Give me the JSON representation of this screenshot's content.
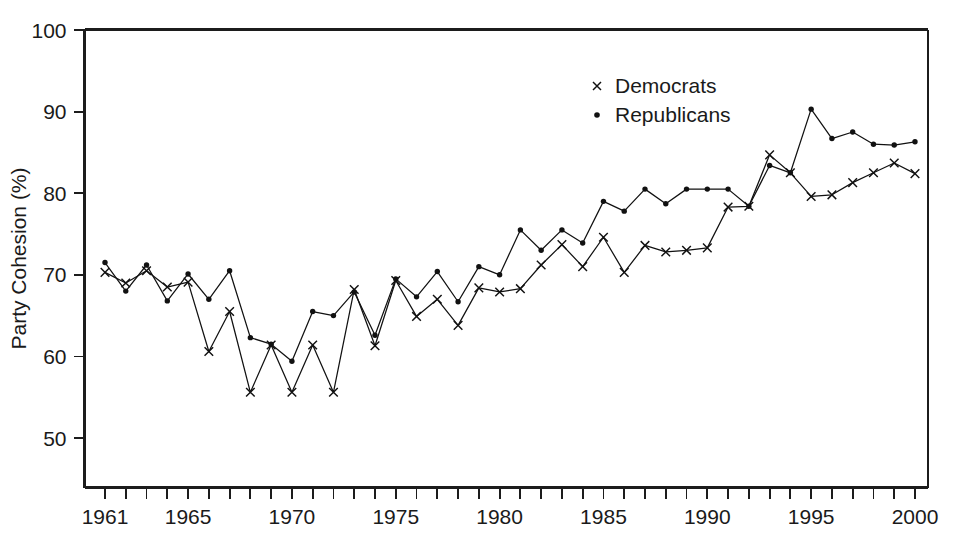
{
  "chart_data": {
    "type": "line",
    "title": "",
    "xlabel": "",
    "ylabel": "Party Cohesion (%)",
    "xlim": [
      1961,
      2000
    ],
    "ylim": [
      47,
      100
    ],
    "y_ticks": [
      50,
      60,
      70,
      80,
      90,
      100
    ],
    "y_tick_labels": [
      "50",
      "60",
      "70",
      "80",
      "90",
      "100"
    ],
    "x_ticks": [
      1961,
      1962,
      1963,
      1964,
      1965,
      1966,
      1967,
      1968,
      1969,
      1970,
      1971,
      1972,
      1973,
      1974,
      1975,
      1976,
      1977,
      1978,
      1979,
      1980,
      1981,
      1982,
      1983,
      1984,
      1985,
      1986,
      1987,
      1988,
      1989,
      1990,
      1991,
      1992,
      1993,
      1994,
      1995,
      1996,
      1997,
      1998,
      1999,
      2000
    ],
    "x_tick_labels": [
      "1961",
      "1965",
      "1970",
      "1975",
      "1980",
      "1985",
      "1990",
      "1995",
      "2000"
    ],
    "x_labeled_years": [
      1961,
      1965,
      1970,
      1975,
      1980,
      1985,
      1990,
      1995,
      2000
    ],
    "grid": false,
    "legend_position": "top-center",
    "x": [
      1961,
      1962,
      1963,
      1964,
      1965,
      1966,
      1967,
      1968,
      1969,
      1970,
      1971,
      1972,
      1973,
      1974,
      1975,
      1976,
      1977,
      1978,
      1979,
      1980,
      1981,
      1982,
      1983,
      1984,
      1985,
      1986,
      1987,
      1988,
      1989,
      1990,
      1991,
      1992,
      1993,
      1994,
      1995,
      1996,
      1997,
      1998,
      1999,
      2000
    ],
    "series": [
      {
        "name": "Democrats",
        "marker": "x",
        "color": "#111111",
        "values": [
          70.3,
          69.0,
          70.5,
          68.5,
          69.1,
          60.6,
          65.5,
          55.6,
          61.4,
          55.6,
          61.4,
          55.6,
          68.2,
          61.3,
          69.3,
          64.9,
          67.0,
          63.8,
          68.4,
          67.9,
          68.3,
          71.2,
          73.7,
          71.0,
          74.6,
          70.3,
          73.6,
          72.8,
          73.0,
          73.3,
          78.3,
          78.4,
          84.7,
          82.5,
          79.6,
          79.8,
          81.3,
          82.5,
          83.7,
          82.4
        ]
      },
      {
        "name": "Republicans",
        "marker": "dot",
        "color": "#111111",
        "values": [
          71.5,
          68.0,
          71.2,
          66.8,
          70.1,
          67.0,
          70.5,
          62.3,
          61.5,
          59.4,
          65.5,
          65.0,
          67.9,
          62.6,
          69.5,
          67.3,
          70.4,
          66.7,
          71.0,
          70.0,
          75.5,
          73.0,
          75.5,
          73.9,
          79.0,
          77.8,
          80.5,
          78.7,
          80.5,
          80.5,
          80.5,
          78.4,
          83.4,
          82.5,
          90.3,
          86.7,
          87.5,
          86.0,
          85.9,
          86.3
        ]
      }
    ]
  },
  "legend": {
    "entries": [
      {
        "label": "Democrats",
        "marker": "x"
      },
      {
        "label": "Republicans",
        "marker": "dot"
      }
    ]
  },
  "axes": {
    "y_title": "Party Cohesion (%)"
  }
}
